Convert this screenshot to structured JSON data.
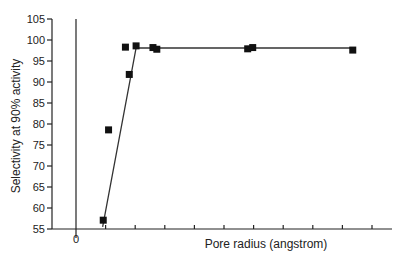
{
  "chart_data": {
    "type": "scatter",
    "title": "",
    "xlabel": "Pore radius (angstrom)",
    "ylabel": "Selectivity at 90% activity",
    "ylim": [
      55,
      105
    ],
    "yticks": [
      55,
      60,
      65,
      70,
      75,
      80,
      85,
      90,
      95,
      100,
      105
    ],
    "xlim": [
      -0.8,
      10.5
    ],
    "xticks": [
      0,
      1,
      2,
      3,
      4,
      5,
      6,
      7,
      8,
      9,
      10
    ],
    "xtick_labels": [
      "0"
    ],
    "grid": false,
    "legend": null,
    "series": [
      {
        "name": "Measured",
        "style": "square markers",
        "x": [
          0.92,
          1.1,
          1.67,
          1.8,
          2.03,
          2.6,
          2.73,
          5.8,
          5.97,
          9.35
        ],
        "y": [
          57.1,
          78.6,
          98.3,
          91.8,
          98.6,
          98.2,
          97.8,
          97.9,
          98.2,
          97.6
        ]
      },
      {
        "name": "Fit line",
        "style": "line",
        "x": [
          0.9,
          2.03,
          9.4
        ],
        "y": [
          55.5,
          98.1,
          98.1
        ]
      }
    ],
    "annotations": [
      "vertical line at x = 0"
    ]
  }
}
